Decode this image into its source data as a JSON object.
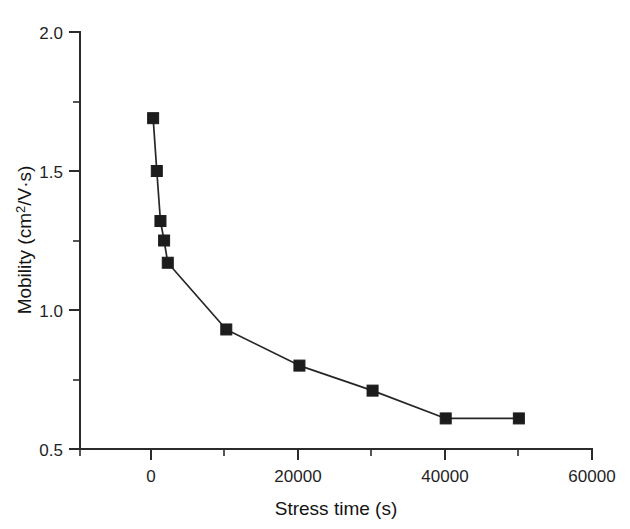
{
  "chart_data": {
    "type": "line",
    "title": "",
    "xlabel": "Stress time (s)",
    "ylabel": "Mobility (cm²/V·s)",
    "ylabel_parts": {
      "prefix": "Mobility (cm",
      "superscript": "2",
      "suffix": "/V·s)"
    },
    "x": [
      0,
      500,
      1000,
      1500,
      2000,
      10000,
      20000,
      30000,
      40000,
      50000
    ],
    "values": [
      1.69,
      1.5,
      1.32,
      1.25,
      1.17,
      0.93,
      0.8,
      0.71,
      0.61,
      0.61
    ],
    "series": [
      {
        "name": "Mobility vs stress time",
        "marker": "filled-square",
        "marker_color": "#1c1c1c",
        "line_color": "#262626",
        "points": [
          {
            "x": 0,
            "y": 1.69
          },
          {
            "x": 500,
            "y": 1.5
          },
          {
            "x": 1000,
            "y": 1.32
          },
          {
            "x": 1500,
            "y": 1.25
          },
          {
            "x": 2000,
            "y": 1.17
          },
          {
            "x": 10000,
            "y": 0.93
          },
          {
            "x": 20000,
            "y": 0.8
          },
          {
            "x": 30000,
            "y": 0.71
          },
          {
            "x": 40000,
            "y": 0.61
          },
          {
            "x": 50000,
            "y": 0.61
          }
        ]
      }
    ],
    "xlim": [
      -10000,
      60000
    ],
    "ylim": [
      0.5,
      2.0
    ],
    "x_major_ticks": [
      0,
      20000,
      40000,
      60000
    ],
    "x_major_tick_labels": [
      "0",
      "20000",
      "40000",
      "60000"
    ],
    "x_minor_ticks": [
      -10000,
      10000,
      30000,
      50000
    ],
    "y_major_ticks": [
      0.5,
      1.0,
      1.5,
      2.0
    ],
    "y_major_tick_labels": [
      "0.5",
      "1.0",
      "1.5",
      "2.0"
    ],
    "y_minor_ticks": [
      0.75,
      1.25,
      1.75
    ],
    "grid": false,
    "legend": null,
    "legend_position": "none",
    "axes_style": "left-and-bottom-spines",
    "annotations": []
  }
}
